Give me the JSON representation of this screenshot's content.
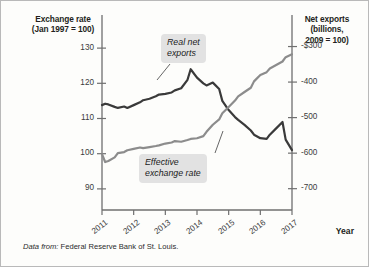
{
  "figure": {
    "left_axis_title": "Exchange rate\n(Jan 1997 = 100)",
    "right_axis_title": "Net exports\n(billions,\n2009 = 100)",
    "x_axis_title": "Year",
    "source_lead": "Data from:",
    "source_text": " Federal Reserve Bank of St. Louis.",
    "callout_net_exports": "Real net\nexports",
    "callout_exchange_rate": "Effective\nexchange rate",
    "colors": {
      "exchange_rate_line": "#3a3a3a",
      "net_exports_line": "#8c8c8c",
      "axis": "#6f6f6f",
      "callout_background": "#e2e2e2",
      "frame": "#b9b9b9",
      "background": "#fdfdfb"
    }
  },
  "chart_data": {
    "type": "line",
    "title": "",
    "xlabel": "Year",
    "grid": false,
    "legend_position": "inline-callouts",
    "x": [
      2011.0,
      2011.1,
      2011.2,
      2011.4,
      2011.5,
      2011.7,
      2011.8,
      2012.0,
      2012.2,
      2012.3,
      2012.5,
      2012.7,
      2012.8,
      2013.0,
      2013.2,
      2013.3,
      2013.5,
      2013.7,
      2013.8,
      2014.0,
      2014.2,
      2014.3,
      2014.5,
      2014.7,
      2014.8,
      2015.0,
      2015.2,
      2015.3,
      2015.5,
      2015.7,
      2015.8,
      2016.0,
      2016.2,
      2016.3,
      2016.5,
      2016.7,
      2016.8,
      2017.0
    ],
    "xticks": [
      "2011",
      "2012",
      "2013",
      "2014",
      "2015",
      "2016",
      "2017"
    ],
    "axes": [
      {
        "id": "left",
        "label": "Exchange rate (Jan 1997 = 100)",
        "ticks": [
          130,
          120,
          110,
          100,
          90
        ],
        "ticklabels": [
          "130",
          "120",
          "110",
          "100",
          "90"
        ],
        "ylim": [
          84,
          136
        ]
      },
      {
        "id": "right",
        "label": "Net exports (billions, 2009 = 100)",
        "ticks": [
          -300,
          -400,
          -500,
          -600,
          -700
        ],
        "ticklabels": [
          "-$300",
          "-400",
          "-500",
          "-600",
          "-700"
        ],
        "ylim": [
          -760,
          -245
        ]
      }
    ],
    "series": [
      {
        "name": "Effective exchange rate",
        "axis": "left",
        "color": "#3a3a3a",
        "units": "index (Jan 1997 = 100)",
        "values": [
          113.8,
          114.2,
          114.0,
          113.3,
          113.0,
          113.4,
          113.0,
          113.8,
          114.6,
          115.2,
          115.6,
          116.3,
          116.8,
          117.0,
          117.4,
          118.0,
          118.6,
          121.0,
          124.0,
          121.6,
          120.0,
          119.4,
          120.2,
          118.4,
          115.0,
          112.4,
          110.4,
          109.6,
          108.2,
          106.6,
          105.4,
          104.4,
          104.2,
          105.4,
          107.2,
          109.0,
          104.0,
          101.0
        ]
      },
      {
        "name": "Real net exports",
        "axis": "right",
        "color": "#8c8c8c",
        "units": "billions of 2009 dollars",
        "values": [
          -603,
          -625,
          -622,
          -612,
          -600,
          -597,
          -592,
          -588,
          -584,
          -586,
          -583,
          -580,
          -578,
          -573,
          -570,
          -566,
          -568,
          -563,
          -560,
          -558,
          -552,
          -540,
          -520,
          -505,
          -488,
          -470,
          -452,
          -440,
          -428,
          -416,
          -398,
          -380,
          -372,
          -362,
          -352,
          -342,
          -330,
          -322
        ]
      }
    ],
    "annotations": [
      {
        "text": "Real net exports",
        "target_series": "Real net exports",
        "x": 2013.6,
        "style": "italic-box"
      },
      {
        "text": "Effective exchange rate",
        "target_series": "Effective exchange rate",
        "x": 2014.7,
        "style": "italic-box"
      }
    ],
    "source": "Data from: Federal Reserve Bank of St. Louis."
  }
}
